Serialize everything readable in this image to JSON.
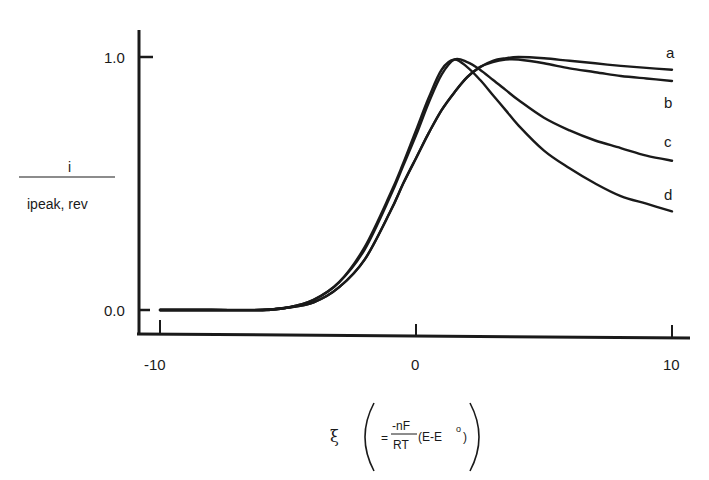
{
  "chart_data": {
    "type": "line",
    "title": "",
    "xlabel": "ξ (= -nF/RT (E-E°))",
    "ylabel": "i / i_peak, rev",
    "xlim": [
      -10,
      10
    ],
    "ylim": [
      0.0,
      1.0
    ],
    "x_ticks": [
      "-10",
      "0",
      "10"
    ],
    "y_ticks": [
      "0.0",
      "1.0"
    ],
    "grid": false,
    "legend": "inline labels at right end of curves",
    "x": [
      -10,
      -8,
      -6,
      -5,
      -4,
      -3,
      -2,
      -1,
      -0.5,
      0,
      0.5,
      1,
      1.5,
      2,
      2.5,
      3,
      3.5,
      4,
      5,
      6,
      7,
      8,
      9,
      10
    ],
    "series": [
      {
        "name": "a",
        "values": [
          0,
          0,
          0,
          0.01,
          0.03,
          0.09,
          0.2,
          0.39,
          0.5,
          0.6,
          0.7,
          0.79,
          0.86,
          0.92,
          0.96,
          0.985,
          0.995,
          1.0,
          0.995,
          0.985,
          0.975,
          0.965,
          0.957,
          0.95
        ]
      },
      {
        "name": "b",
        "values": [
          0,
          0,
          0,
          0.01,
          0.03,
          0.09,
          0.2,
          0.39,
          0.5,
          0.6,
          0.7,
          0.79,
          0.86,
          0.92,
          0.96,
          0.98,
          0.99,
          0.99,
          0.975,
          0.955,
          0.94,
          0.925,
          0.915,
          0.905
        ]
      },
      {
        "name": "c",
        "values": [
          0,
          0,
          0,
          0.01,
          0.04,
          0.11,
          0.24,
          0.45,
          0.57,
          0.69,
          0.82,
          0.93,
          0.99,
          0.98,
          0.95,
          0.91,
          0.87,
          0.83,
          0.76,
          0.71,
          0.67,
          0.64,
          0.61,
          0.59
        ]
      },
      {
        "name": "d",
        "values": [
          0,
          0,
          0,
          0.01,
          0.04,
          0.11,
          0.25,
          0.46,
          0.58,
          0.71,
          0.84,
          0.95,
          0.99,
          0.96,
          0.91,
          0.85,
          0.79,
          0.73,
          0.63,
          0.56,
          0.5,
          0.45,
          0.42,
          0.39
        ]
      }
    ],
    "curve_labels": [
      "a",
      "b",
      "c",
      "d"
    ]
  },
  "axes": {
    "y_tick_top": "1.0",
    "y_tick_bottom": "0.0",
    "x_tick_left": "-10",
    "x_tick_mid": "0",
    "x_tick_right": "10"
  },
  "labels": {
    "y_numerator": "i",
    "y_denominator": "ipeak, rev",
    "x_symbol": "ξ",
    "x_eq": "=",
    "x_frac_num": "-nF",
    "x_frac_den": "RT",
    "x_paren_expr": "(E-E",
    "x_sup": "o",
    "x_close": ")",
    "curve_a": "a",
    "curve_b": "b",
    "curve_c": "c",
    "curve_d": "d"
  }
}
